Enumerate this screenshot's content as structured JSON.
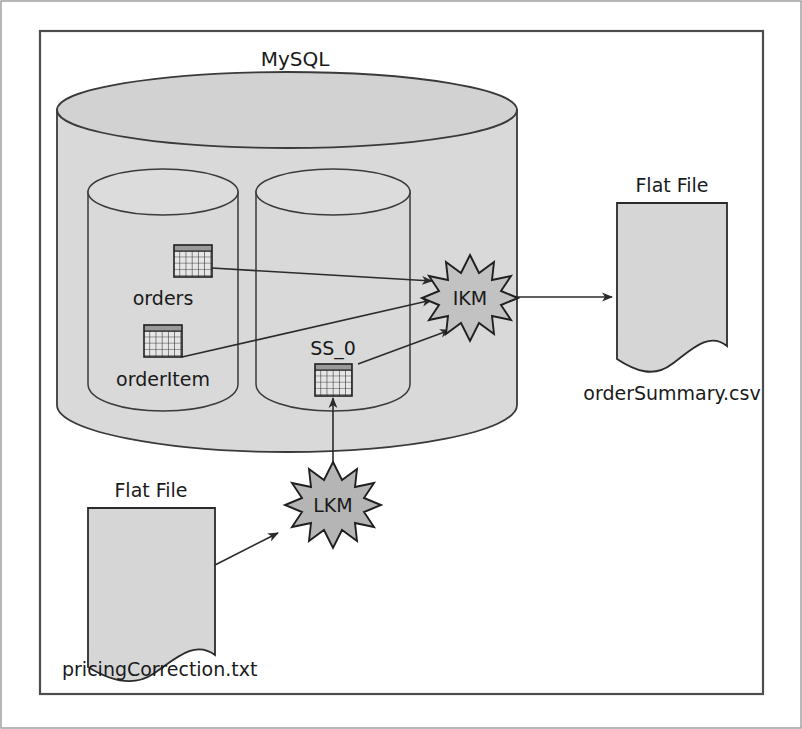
{
  "diagram": {
    "type": "data-integration-mapping",
    "title_visible": false,
    "colors": {
      "fill_light": "#d9d9d9",
      "fill_medium": "#c9c9c9",
      "fill_star": "#b8b8b8",
      "stroke": "#3a3a3a",
      "text": "#1a1a1a",
      "page_border": "#808080",
      "frame_border": "#4d4d4d"
    },
    "source_database": {
      "name": "MySQL",
      "label": "MySQL",
      "schemas": [
        {
          "name": "schema-left",
          "tables": [
            {
              "id": "orders",
              "label": "orders",
              "icon": "table-grid-icon"
            },
            {
              "id": "orderItem",
              "label": "orderItem",
              "icon": "table-grid-icon"
            }
          ]
        },
        {
          "name": "schema-right",
          "tables": [
            {
              "id": "SS_0",
              "label": "SS_0",
              "icon": "table-grid-icon"
            }
          ]
        }
      ]
    },
    "knowledge_modules": [
      {
        "id": "IKM",
        "label": "IKM",
        "kind": "integration-knowledge-module",
        "shape": "explosion-star"
      },
      {
        "id": "LKM",
        "label": "LKM",
        "kind": "loading-knowledge-module",
        "shape": "explosion-star"
      }
    ],
    "flat_files": [
      {
        "id": "orderSummary",
        "type_label": "Flat File",
        "file_label": "orderSummary.csv",
        "role": "target",
        "shape": "document-wavy-bottom"
      },
      {
        "id": "pricingCorrection",
        "type_label": "Flat File",
        "file_label": "pricingCorrection.txt",
        "role": "source",
        "shape": "document-wavy-bottom"
      }
    ],
    "flows": [
      {
        "from": "orders",
        "to": "IKM",
        "style": "solid-arrow"
      },
      {
        "from": "orderItem",
        "to": "IKM",
        "style": "solid-arrow"
      },
      {
        "from": "SS_0",
        "to": "IKM",
        "style": "solid-arrow"
      },
      {
        "from": "IKM",
        "to": "orderSummary",
        "style": "solid-arrow"
      },
      {
        "from": "pricingCorrection",
        "to": "LKM",
        "style": "solid-arrow"
      },
      {
        "from": "LKM",
        "to": "SS_0",
        "style": "solid-arrow"
      }
    ]
  }
}
